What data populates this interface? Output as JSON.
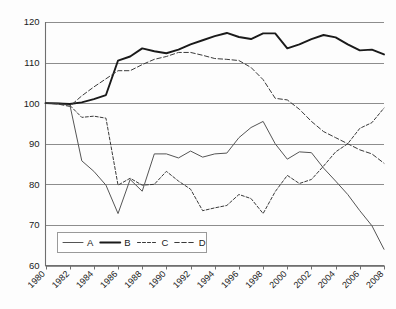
{
  "chart_data": {
    "type": "line",
    "title": "",
    "subtitle": "",
    "xlabel": "",
    "ylabel": "",
    "xlim": [
      1980,
      2008
    ],
    "ylim": [
      60,
      120
    ],
    "ytick_values": [
      60,
      70,
      80,
      90,
      100,
      110,
      120
    ],
    "ytick_labels": [
      "60",
      "70",
      "80",
      "90",
      "100",
      "110",
      "120"
    ],
    "xtick_values": [
      1980,
      1982,
      1984,
      1986,
      1988,
      1990,
      1992,
      1994,
      1996,
      1998,
      2000,
      2002,
      2004,
      2006,
      2008
    ],
    "xtick_labels": [
      "1980",
      "1982",
      "1984",
      "1986",
      "1988",
      "1990",
      "1992",
      "1994",
      "1996",
      "1998",
      "2000",
      "2002",
      "2004",
      "2006",
      "2008"
    ],
    "grid": true,
    "grid_axis": "y",
    "legend_position": "bottom-left",
    "x": [
      1980,
      1981,
      1982,
      1983,
      1984,
      1985,
      1986,
      1987,
      1988,
      1989,
      1990,
      1991,
      1992,
      1993,
      1994,
      1995,
      1996,
      1997,
      1998,
      1999,
      2000,
      2001,
      2002,
      2003,
      2004,
      2005,
      2006,
      2007,
      2008
    ],
    "series": [
      {
        "name": "A",
        "style": "solid-thin",
        "color": "#555555",
        "values": [
          100,
          100,
          99.8,
          85.8,
          83.2,
          79.8,
          72.8,
          81.2,
          78.3,
          87.5,
          87.5,
          86.5,
          88.2,
          86.7,
          87.5,
          87.7,
          91.5,
          94.0,
          95.5,
          90.0,
          86.2,
          88.0,
          87.8,
          84.0,
          80.8,
          77.5,
          73.5,
          69.8,
          64.0
        ]
      },
      {
        "name": "B",
        "style": "solid-thick",
        "color": "#1a1a1a",
        "values": [
          100,
          99.9,
          99.8,
          100.2,
          101.0,
          102.0,
          110.5,
          111.5,
          113.5,
          112.8,
          112.3,
          113.2,
          114.5,
          115.5,
          116.5,
          117.3,
          116.3,
          115.8,
          117.2,
          117.2,
          113.5,
          114.5,
          115.8,
          116.8,
          116.2,
          114.5,
          113.0,
          113.2,
          112.0
        ]
      },
      {
        "name": "C",
        "style": "dashed-fine",
        "color": "#3a3a3a",
        "values": [
          100,
          99.9,
          99.5,
          96.5,
          96.8,
          96.3,
          79.8,
          81.5,
          79.8,
          80.0,
          83.2,
          80.8,
          78.8,
          73.5,
          74.2,
          74.8,
          77.5,
          76.5,
          72.8,
          78.2,
          82.2,
          80.2,
          81.2,
          84.5,
          88.0,
          90.0,
          93.8,
          95.2,
          98.8
        ]
      },
      {
        "name": "D",
        "style": "dashed-coarse",
        "color": "#3a3a3a",
        "values": [
          100,
          99.8,
          99.2,
          101.8,
          104.0,
          106.0,
          108.0,
          108.0,
          109.5,
          110.8,
          111.5,
          112.5,
          112.5,
          111.8,
          111.0,
          110.8,
          110.5,
          108.8,
          105.8,
          101.2,
          100.8,
          98.5,
          95.5,
          93.0,
          91.5,
          90.0,
          88.5,
          87.5,
          85.2
        ]
      }
    ]
  },
  "legend": {
    "entries": [
      {
        "label": "A"
      },
      {
        "label": "B"
      },
      {
        "label": "C"
      },
      {
        "label": "D"
      }
    ]
  }
}
